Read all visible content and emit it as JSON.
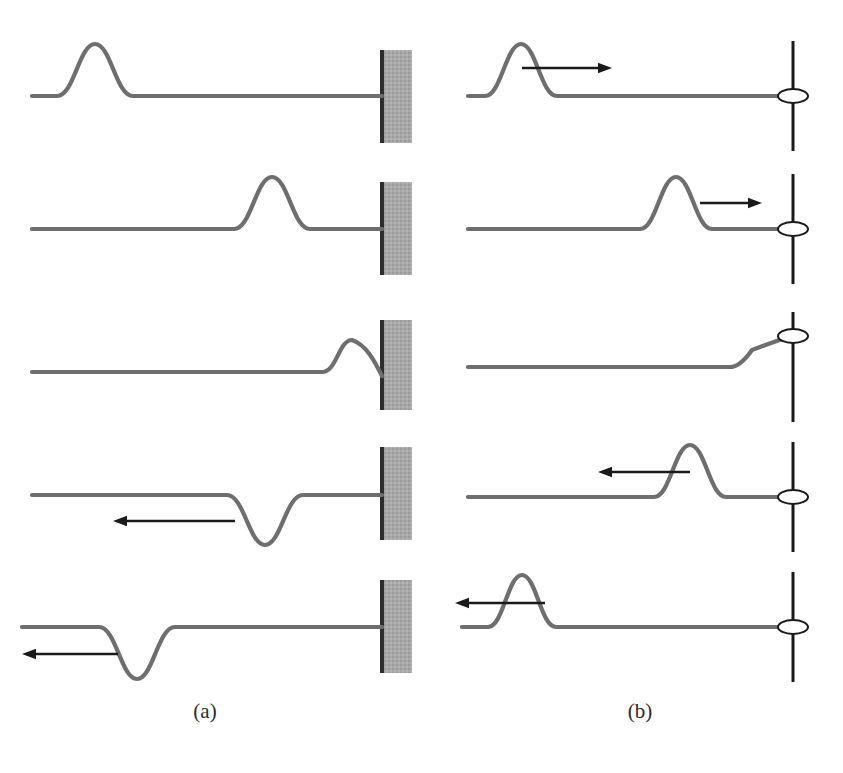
{
  "figure": {
    "width": 843,
    "height": 773,
    "background_color": "#ffffff",
    "string_color": "#6e6e6e",
    "string_width": 4.2,
    "arrow_color": "#1a1a1a",
    "wall_fill_color": "#a8a8a8",
    "wall_edge_color": "#2d2d2d",
    "pole_color": "#1a1a1a",
    "ring_stroke_color": "#1a1a1a"
  },
  "panels": [
    {
      "id": "a",
      "label": "(a)",
      "label_x": 205,
      "label_y": 718,
      "boundary_type": "fixed-end-wall",
      "description": "Pulse reflects from a fixed end and is inverted",
      "wall": {
        "x": 380,
        "width": 32,
        "edge_width": 4
      },
      "frames": [
        {
          "index": 1,
          "baseline_y": 96,
          "string_start_x": 32,
          "string_end_x": 382,
          "pulse": {
            "center_x": 95,
            "amplitude": 52,
            "half_width": 38,
            "direction": "right"
          },
          "arrow": null,
          "wall_top": 50,
          "wall_bottom": 143
        },
        {
          "index": 2,
          "baseline_y": 229,
          "string_start_x": 32,
          "string_end_x": 382,
          "pulse": {
            "center_x": 272,
            "amplitude": 52,
            "half_width": 38,
            "direction": "right"
          },
          "arrow": null,
          "wall_top": 182,
          "wall_bottom": 275
        },
        {
          "index": 3,
          "baseline_y": 372,
          "string_start_x": 32,
          "string_end_x": 382,
          "pulse": {
            "center_x": 352,
            "amplitude": 32,
            "half_width": 30,
            "direction": "right",
            "partial": true
          },
          "arrow": null,
          "wall_top": 320,
          "wall_bottom": 410
        },
        {
          "index": 4,
          "baseline_y": 495,
          "string_start_x": 32,
          "string_end_x": 382,
          "pulse": {
            "center_x": 265,
            "amplitude": -50,
            "half_width": 38,
            "direction": "left"
          },
          "arrow": {
            "tip_x": 113,
            "tail_x": 235,
            "y": 521,
            "direction": "left"
          },
          "wall_top": 447,
          "wall_bottom": 540
        },
        {
          "index": 5,
          "baseline_y": 627,
          "string_start_x": 22,
          "string_end_x": 382,
          "pulse": {
            "center_x": 137,
            "amplitude": -52,
            "half_width": 38,
            "direction": "left"
          },
          "arrow": {
            "tip_x": 22,
            "tail_x": 118,
            "y": 654,
            "direction": "left"
          },
          "wall_top": 580,
          "wall_bottom": 673
        }
      ]
    },
    {
      "id": "b",
      "label": "(b)",
      "label_x": 640,
      "label_y": 718,
      "boundary_type": "free-end-ring-on-pole",
      "description": "Pulse reflects from a free end (ring on frictionless pole) and is not inverted",
      "pole": {
        "x": 793,
        "width": 3,
        "half_height": 55
      },
      "ring": {
        "rx": 15,
        "ry": 7
      },
      "frames": [
        {
          "index": 1,
          "baseline_y": 96,
          "string_start_x": 468,
          "string_end_x": 793,
          "pulse": {
            "center_x": 521,
            "amplitude": 52,
            "half_width": 36,
            "direction": "right"
          },
          "arrow": {
            "tip_x": 612,
            "tail_x": 522,
            "y": 68,
            "direction": "right"
          },
          "ring_y": 96
        },
        {
          "index": 2,
          "baseline_y": 229,
          "string_start_x": 468,
          "string_end_x": 793,
          "pulse": {
            "center_x": 676,
            "amplitude": 52,
            "half_width": 36,
            "direction": "right"
          },
          "arrow": {
            "tip_x": 762,
            "tail_x": 700,
            "y": 203,
            "direction": "right"
          },
          "ring_y": 229
        },
        {
          "index": 3,
          "baseline_y": 367,
          "string_start_x": 468,
          "string_end_x": 793,
          "pulse": {
            "center_x": 770,
            "amplitude": 32,
            "half_width": 40,
            "direction": "right",
            "ring_lifted": true
          },
          "arrow": null,
          "ring_y": 336
        },
        {
          "index": 4,
          "baseline_y": 497,
          "string_start_x": 468,
          "string_end_x": 793,
          "pulse": {
            "center_x": 690,
            "amplitude": 52,
            "half_width": 36,
            "direction": "left"
          },
          "arrow": {
            "tip_x": 598,
            "tail_x": 690,
            "y": 472,
            "direction": "left"
          },
          "ring_y": 497
        },
        {
          "index": 5,
          "baseline_y": 627,
          "string_start_x": 462,
          "string_end_x": 793,
          "pulse": {
            "center_x": 522,
            "amplitude": 52,
            "half_width": 34,
            "direction": "left"
          },
          "arrow": {
            "tip_x": 455,
            "tail_x": 545,
            "y": 603,
            "direction": "left"
          },
          "ring_y": 627
        }
      ]
    }
  ],
  "margin_notes": {
    "visible": true,
    "note_1": "",
    "note_2": "",
    "note_3": ""
  }
}
